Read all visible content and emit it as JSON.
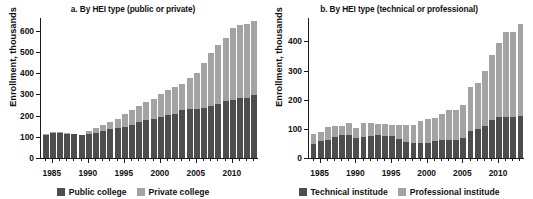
{
  "figure": {
    "background": "#ffffff",
    "dark_color": "#4d4d4d",
    "light_color": "#a3a3a3",
    "axis_color": "#1a1a1a"
  },
  "panels": [
    {
      "id": "a",
      "title": "a. By HEI type (public or private)",
      "ylabel": "Enrollment, thousands",
      "legend": [
        {
          "label": "Public college",
          "color": "#4d4d4d"
        },
        {
          "label": "Private college",
          "color": "#a3a3a3"
        }
      ]
    },
    {
      "id": "b",
      "title": "b. By HEI type (technical or professional)",
      "ylabel": "Enrollment, thousands",
      "legend": [
        {
          "label": "Technical institude",
          "color": "#4d4d4d"
        },
        {
          "label": "Professional institude",
          "color": "#a3a3a3"
        }
      ]
    }
  ],
  "chart_data": [
    {
      "type": "bar",
      "stacked": true,
      "panel": "a",
      "title": "a. By HEI type (public or private)",
      "xlabel": "",
      "ylabel": "Enrollment, thousands",
      "ylim": [
        0,
        660
      ],
      "yticks": [
        0,
        100,
        200,
        300,
        400,
        500,
        600
      ],
      "xticks": [
        1985,
        1990,
        1995,
        2000,
        2005,
        2010
      ],
      "grid": false,
      "legend_position": "bottom",
      "x": [
        1984,
        1985,
        1986,
        1987,
        1988,
        1989,
        1990,
        1991,
        1992,
        1993,
        1994,
        1995,
        1996,
        1997,
        1998,
        1999,
        2000,
        2001,
        2002,
        2003,
        2004,
        2005,
        2006,
        2007,
        2008,
        2009,
        2010,
        2011,
        2012,
        2013
      ],
      "series": [
        {
          "name": "Public college",
          "color": "#4d4d4d",
          "values": [
            110,
            119,
            118,
            114,
            112,
            107,
            112,
            119,
            127,
            136,
            141,
            148,
            156,
            168,
            178,
            186,
            194,
            201,
            206,
            226,
            230,
            232,
            236,
            243,
            255,
            268,
            273,
            281,
            283,
            296
          ]
        },
        {
          "name": "Private college",
          "color": "#a3a3a3",
          "values": [
            3,
            3,
            3,
            3,
            3,
            3,
            17,
            22,
            28,
            34,
            45,
            58,
            69,
            77,
            86,
            92,
            108,
            121,
            128,
            124,
            148,
            171,
            211,
            250,
            280,
            299,
            338,
            348,
            351,
            350
          ]
        }
      ]
    },
    {
      "type": "bar",
      "stacked": true,
      "panel": "b",
      "title": "b. By HEI type (technical or professional)",
      "xlabel": "",
      "ylabel": "Enrollment, thousands",
      "ylim": [
        0,
        480
      ],
      "yticks": [
        0,
        100,
        200,
        300,
        400
      ],
      "xticks": [
        1985,
        1990,
        1995,
        2000,
        2005,
        2010
      ],
      "grid": false,
      "legend_position": "bottom",
      "x": [
        1984,
        1985,
        1986,
        1987,
        1988,
        1989,
        1990,
        1991,
        1992,
        1993,
        1994,
        1995,
        1996,
        1997,
        1998,
        1999,
        2000,
        2001,
        2002,
        2003,
        2004,
        2005,
        2006,
        2007,
        2008,
        2009,
        2010,
        2011,
        2012,
        2013
      ],
      "series": [
        {
          "name": "Technical institude",
          "color": "#4d4d4d",
          "values": [
            48,
            59,
            63,
            73,
            78,
            78,
            68,
            72,
            77,
            78,
            74,
            74,
            64,
            56,
            53,
            52,
            53,
            59,
            62,
            63,
            63,
            70,
            92,
            99,
            110,
            130,
            139,
            140,
            141,
            145
          ]
        },
        {
          "name": "Professional institude",
          "color": "#a3a3a3",
          "values": [
            34,
            30,
            45,
            37,
            33,
            42,
            36,
            47,
            42,
            37,
            41,
            38,
            48,
            56,
            60,
            74,
            81,
            77,
            90,
            101,
            102,
            112,
            151,
            158,
            189,
            223,
            257,
            291,
            290,
            316
          ]
        }
      ]
    }
  ]
}
